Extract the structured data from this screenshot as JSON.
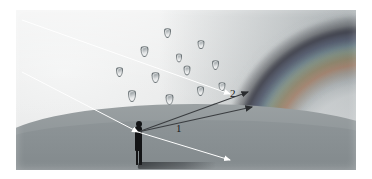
{
  "figure": {
    "kind": "rainbow-formation-diagram",
    "background_color": "#d8dadb",
    "plate_border_color": "#ffffff"
  },
  "labels": [
    {
      "id": "ray-1",
      "text": "1",
      "meaning": "primary-bow-sight-line"
    },
    {
      "id": "ray-2",
      "text": "2",
      "meaning": "secondary-bow-sight-line"
    }
  ],
  "elements": {
    "observer": {
      "name": "observer-silhouette",
      "description": "person standing on ground viewing rainbow"
    },
    "ground": {
      "name": "ground-plane",
      "color": "#8e9598"
    },
    "sky": {
      "name": "sky-gradient",
      "color": "#e6e8e8"
    },
    "rainbow": {
      "name": "rainbow-arc",
      "bands": [
        "red",
        "orange",
        "yellow",
        "green",
        "blue",
        "violet"
      ]
    },
    "cloud": {
      "name": "rain-cloud",
      "color": "#e8eaea"
    },
    "shadow": {
      "name": "observer-shadow"
    }
  },
  "raindrops": [
    {
      "x": 148,
      "y": 18,
      "w": 5,
      "h": 8
    },
    {
      "x": 125,
      "y": 36,
      "w": 5.5,
      "h": 9
    },
    {
      "x": 160,
      "y": 44,
      "w": 4,
      "h": 6.5
    },
    {
      "x": 182,
      "y": 30,
      "w": 4.5,
      "h": 7
    },
    {
      "x": 100,
      "y": 57,
      "w": 5,
      "h": 8
    },
    {
      "x": 136,
      "y": 62,
      "w": 5.5,
      "h": 9
    },
    {
      "x": 168,
      "y": 56,
      "w": 4.5,
      "h": 7.5
    },
    {
      "x": 196,
      "y": 50,
      "w": 5,
      "h": 8
    },
    {
      "x": 112,
      "y": 80,
      "w": 6,
      "h": 10
    },
    {
      "x": 150,
      "y": 84,
      "w": 5.5,
      "h": 9
    },
    {
      "x": 181,
      "y": 76,
      "w": 5,
      "h": 8
    },
    {
      "x": 203,
      "y": 72,
      "w": 4.5,
      "h": 7
    },
    {
      "x": 92,
      "y": 99,
      "w": 5.5,
      "h": 9
    },
    {
      "x": 128,
      "y": 106,
      "w": 5,
      "h": 8.5
    },
    {
      "x": 164,
      "y": 98,
      "w": 5.5,
      "h": 9
    },
    {
      "x": 196,
      "y": 94,
      "w": 4.5,
      "h": 7.5
    },
    {
      "x": 118,
      "y": 125,
      "w": 5,
      "h": 8
    },
    {
      "x": 154,
      "y": 130,
      "w": 4,
      "h": 6
    },
    {
      "x": 186,
      "y": 120,
      "w": 5,
      "h": 8
    },
    {
      "x": 210,
      "y": 112,
      "w": 4,
      "h": 6.5
    }
  ],
  "rays": {
    "sunlight": [
      {
        "name": "sunlight-ray-upper",
        "x1": 6,
        "y1": 10,
        "x2": 214,
        "y2": 84
      },
      {
        "name": "sunlight-ray-lower",
        "x1": 6,
        "y1": 62,
        "x2": 122,
        "y2": 122
      }
    ],
    "sight_lines": [
      {
        "name": "sight-line-1",
        "x1": 122,
        "y1": 122,
        "x2": 236,
        "y2": 97
      },
      {
        "name": "sight-line-2",
        "x1": 122,
        "y1": 122,
        "x2": 232,
        "y2": 82
      },
      {
        "name": "sight-line-horizon",
        "x1": 122,
        "y1": 122,
        "x2": 214,
        "y2": 150
      }
    ]
  }
}
